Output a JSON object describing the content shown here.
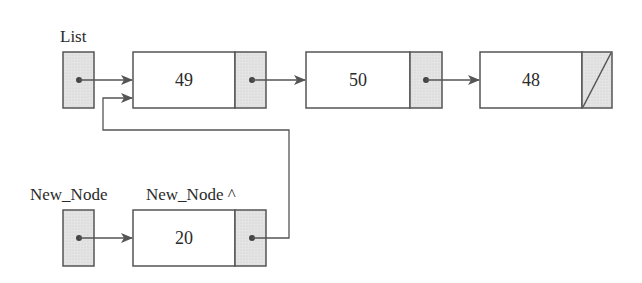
{
  "labels": {
    "list": "List",
    "new_node_var": "New_Node",
    "new_node_deref": "New_Node ^"
  },
  "nodes": [
    {
      "id": "node-49",
      "value": "49",
      "next": "node-50"
    },
    {
      "id": "node-50",
      "value": "50",
      "next": "node-48"
    },
    {
      "id": "node-48",
      "value": "48",
      "next": null
    },
    {
      "id": "node-20",
      "value": "20",
      "next": "node-49"
    }
  ],
  "colors": {
    "stroke": "#555555",
    "pointer_fill": "#e2e2e2",
    "data_fill": "#ffffff",
    "text": "#2a2a2a"
  }
}
